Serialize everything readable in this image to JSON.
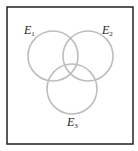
{
  "diagram": {
    "type": "venn",
    "frame": {
      "x": 7,
      "y": 7,
      "width": 126,
      "height": 137,
      "stroke": "#222222"
    },
    "circle_stroke": "#bdbdbd",
    "sets": [
      {
        "name": "E",
        "subscript": "1",
        "cx": 53,
        "cy": 56,
        "r": 25,
        "label_x": 24,
        "label_y": 34
      },
      {
        "name": "E",
        "subscript": "2",
        "cx": 88,
        "cy": 56,
        "r": 25,
        "label_x": 102,
        "label_y": 34
      },
      {
        "name": "E",
        "subscript": "3",
        "cx": 72,
        "cy": 89,
        "r": 25,
        "label_x": 67,
        "label_y": 126
      }
    ]
  }
}
